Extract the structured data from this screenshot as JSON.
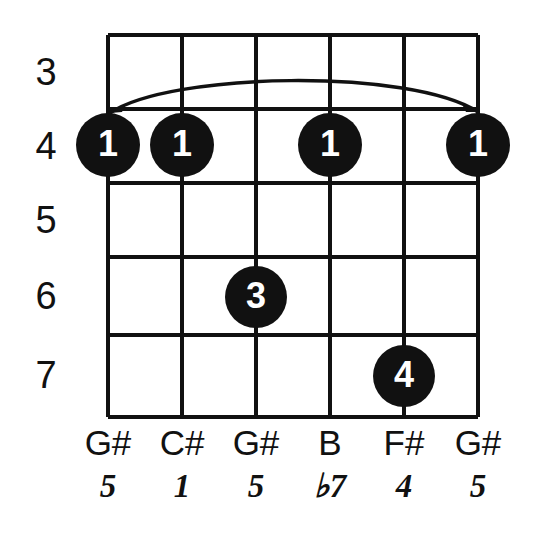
{
  "diagram": {
    "type": "guitar-chord-diagram",
    "fret_numbers": [
      "3",
      "4",
      "5",
      "6",
      "7"
    ],
    "note_names": [
      "G#",
      "C#",
      "G#",
      "B",
      "F#",
      "G#"
    ],
    "intervals": [
      "5",
      "1",
      "5",
      "♭7",
      "4",
      "5"
    ],
    "finger_dots": [
      {
        "label": "1",
        "string_index": 0,
        "fret_index": 1
      },
      {
        "label": "1",
        "string_index": 1,
        "fret_index": 1
      },
      {
        "label": "1",
        "string_index": 3,
        "fret_index": 1
      },
      {
        "label": "1",
        "string_index": 5,
        "fret_index": 1
      },
      {
        "label": "3",
        "string_index": 2,
        "fret_index": 3
      },
      {
        "label": "4",
        "string_index": 4,
        "fret_index": 4
      }
    ],
    "barre": {
      "name": "barre-curve",
      "from_string_index": 0,
      "to_string_index": 5,
      "fret_index": 1
    },
    "colors": {
      "ink": "#111111",
      "background": "#ffffff",
      "dot_fill": "#111111",
      "dot_text": "#ffffff"
    }
  }
}
